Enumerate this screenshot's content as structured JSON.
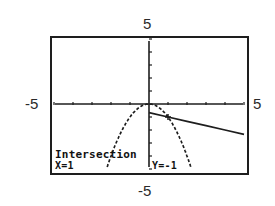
{
  "window": {
    "xmin_label": "-5",
    "xmax_label": "5",
    "ymin_label": "-5",
    "ymax_label": "5"
  },
  "readout": {
    "title": "Intersection",
    "x_text": "X=1",
    "y_text": "Y=-1"
  },
  "colors": {
    "ink": "#1e1e1e",
    "background": "#ffffff"
  },
  "chart_data": {
    "type": "line",
    "title": "",
    "xlabel": "",
    "ylabel": "",
    "xlim": [
      -5,
      5
    ],
    "ylim": [
      -5,
      5
    ],
    "grid": false,
    "tick_spacing": 1,
    "series": [
      {
        "name": "parabola y = -x^2",
        "style": "dotted",
        "x": [
          -2.2,
          -2,
          -1.5,
          -1,
          -0.5,
          0,
          0.5,
          1,
          1.5,
          2,
          2.2
        ],
        "y": [
          -4.84,
          -4,
          -2.25,
          -1,
          -0.25,
          0,
          -0.25,
          -1,
          -2.25,
          -4,
          -4.84
        ]
      },
      {
        "name": "line",
        "style": "solid",
        "x": [
          0,
          1,
          2,
          3,
          4,
          5
        ],
        "y": [
          -0.67,
          -1,
          -1.33,
          -1.67,
          -2,
          -2.33
        ]
      }
    ],
    "annotations": [
      {
        "text": "Intersection",
        "x": 1,
        "y": -1
      },
      {
        "text": "X=1"
      },
      {
        "text": "Y=-1"
      }
    ]
  }
}
